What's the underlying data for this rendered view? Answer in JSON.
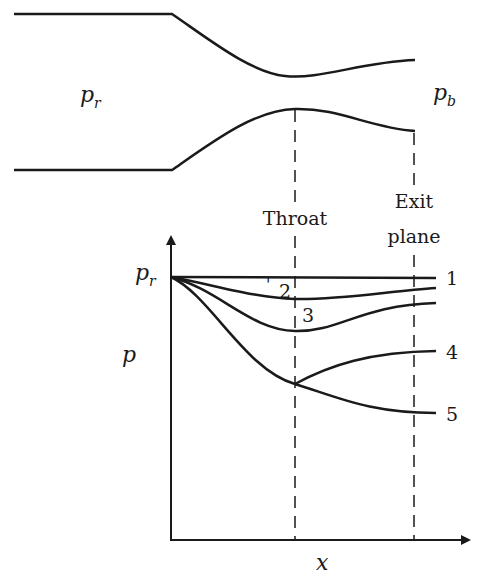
{
  "diagram": {
    "type": "converging-diverging nozzle with pressure distribution",
    "nozzle": {
      "inlet_label": "p",
      "inlet_subscript": "r",
      "outlet_label": "p",
      "outlet_subscript": "b"
    },
    "stations": {
      "throat_label": "Throat",
      "exit_label_line1": "Exit",
      "exit_label_line2": "plane"
    },
    "axes": {
      "y_label": "p",
      "x_label": "x",
      "y_ref_label": "p",
      "y_ref_subscript": "r"
    },
    "curves": [
      {
        "id": "1",
        "label": "1",
        "description": "no flow, p = p_r everywhere"
      },
      {
        "id": "2",
        "label": "2",
        "description": "subsonic throughout, slight dip at throat"
      },
      {
        "id": "3",
        "label": "3",
        "description": "subsonic, deeper dip at throat then recovery"
      },
      {
        "id": "4",
        "label": "4",
        "description": "choked, sonic at throat, subsonic diffusion after"
      },
      {
        "id": "5",
        "label": "5",
        "description": "choked, supersonic expansion after throat"
      }
    ],
    "colors": {
      "line": "#1a1a1a",
      "background": "#ffffff"
    }
  }
}
